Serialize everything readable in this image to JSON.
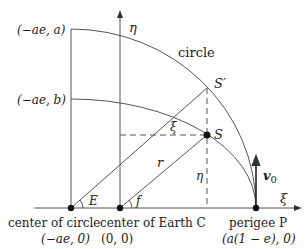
{
  "figure": {
    "colors": {
      "stroke": "#555555",
      "text": "#222222",
      "dot": "#111111"
    },
    "axes": {
      "eta_label": "η",
      "xi_label": "ξ"
    },
    "curves": {
      "circle_label": "circle"
    },
    "points": {
      "top_circle": "(−ae, a)",
      "top_ellipse": "(−ae, b)",
      "S_prime": "S′",
      "S": "S",
      "E_angle": "E",
      "f_angle": "f"
    },
    "segments": {
      "xi_label": "ξ",
      "eta_label": "η",
      "r_label": "r"
    },
    "velocity": {
      "label": "v",
      "subscript": "0"
    },
    "bottom": {
      "circle_center_title": "center of circle",
      "circle_center_coords": "(−ae, 0)",
      "earth_center_title": "center of Earth C",
      "earth_center_coords": "(0, 0)",
      "perigee_title": "perigee P",
      "perigee_coords": "(a(1 − e), 0)"
    }
  }
}
